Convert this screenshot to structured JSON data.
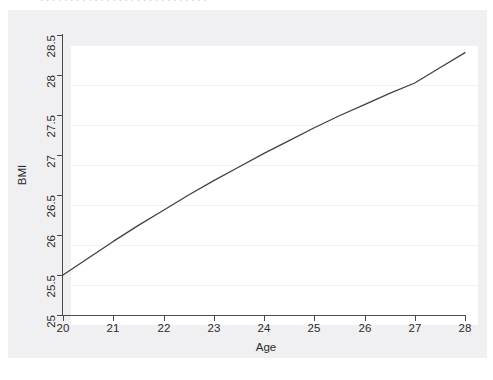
{
  "figure": {
    "top_cut_text": "............................",
    "background_color": "#f0f0f2",
    "panel_color": "#ffffff",
    "line_color": "#404040",
    "grid_color": "#f2f2f4",
    "axis_color": "#4a4a4a"
  },
  "chart_data": {
    "type": "line",
    "title": "",
    "xlabel": "Age",
    "ylabel": "BMI",
    "xlim": [
      20,
      28
    ],
    "ylim": [
      25,
      28.5
    ],
    "xticks": [
      20,
      21,
      22,
      23,
      24,
      25,
      26,
      27,
      28
    ],
    "xticklabels": [
      "20",
      "21",
      "22",
      "23",
      "24",
      "25",
      "26",
      "27",
      "28"
    ],
    "yticks": [
      25,
      25.5,
      26,
      26.5,
      27,
      27.5,
      28,
      28.5
    ],
    "yticklabels": [
      "25",
      "25.5",
      "26",
      "26.5",
      "27",
      "27.5",
      "28",
      "28.5"
    ],
    "grid": "horizontal",
    "legend": "none",
    "x": [
      20,
      20.5,
      21,
      21.5,
      22,
      22.5,
      23,
      23.5,
      24,
      24.5,
      25,
      25.5,
      26,
      26.5,
      27,
      27.5,
      28
    ],
    "y": [
      25.5,
      25.71,
      25.92,
      26.12,
      26.31,
      26.5,
      26.68,
      26.85,
      27.02,
      27.18,
      27.34,
      27.49,
      27.63,
      27.77,
      27.9,
      28.09,
      28.28
    ],
    "series": [
      {
        "name": "Predicted BMI",
        "x": [
          20,
          21,
          22,
          23,
          24,
          25,
          26,
          27,
          28
        ],
        "values": [
          25.5,
          25.92,
          26.31,
          26.68,
          27.02,
          27.34,
          27.63,
          27.9,
          28.28
        ]
      }
    ]
  }
}
